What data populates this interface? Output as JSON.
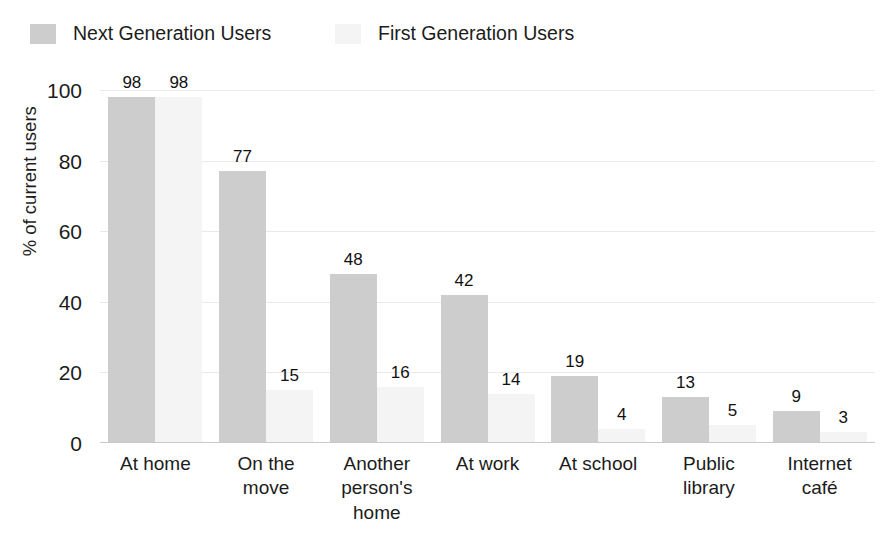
{
  "chart_data": {
    "type": "bar",
    "title": "",
    "subtitle": "",
    "xlabel": "",
    "ylabel": "% of current users",
    "ylim": [
      0,
      100
    ],
    "yticks": [
      0,
      20,
      40,
      60,
      80,
      100
    ],
    "grid": true,
    "legend_position": "top-left",
    "categories": [
      "At home",
      "On the move",
      "Another person's home",
      "At work",
      "At school",
      "Public library",
      "Internet café"
    ],
    "category_lines": [
      [
        "At home"
      ],
      [
        "On the",
        "move"
      ],
      [
        "Another",
        "person's",
        "home"
      ],
      [
        "At work"
      ],
      [
        "At school"
      ],
      [
        "Public",
        "library"
      ],
      [
        "Internet",
        "café"
      ]
    ],
    "series": [
      {
        "name": "Next Generation Users",
        "color": "#cdcdcd",
        "values": [
          98,
          77,
          48,
          42,
          19,
          13,
          9
        ]
      },
      {
        "name": "First Generation Users",
        "color": "#f4f4f4",
        "values": [
          98,
          15,
          16,
          14,
          4,
          5,
          3
        ]
      }
    ]
  },
  "axis": {
    "ytick_labels": [
      "0",
      "20",
      "40",
      "60",
      "80",
      "100"
    ],
    "y_axis_title": "% of current users"
  },
  "legend": {
    "items": [
      {
        "label": "Next Generation Users",
        "color": "#cdcdcd"
      },
      {
        "label": "First Generation Users",
        "color": "#f4f4f4"
      }
    ]
  }
}
